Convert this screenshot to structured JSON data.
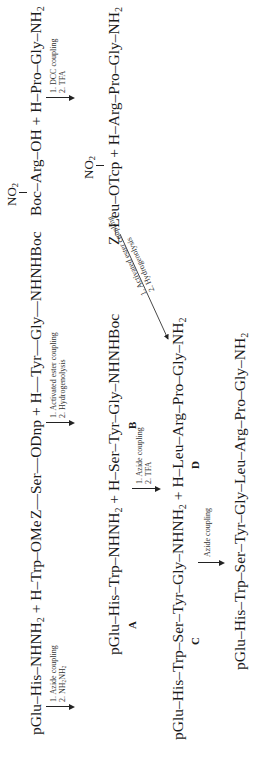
{
  "diagram": {
    "type": "peptide-synthesis-scheme",
    "orientation": "rotated-90-ccw",
    "row1": {
      "left": {
        "reactant1": "pGlu–His–NHNH",
        "reactant1_sub": "2",
        "plus": "+",
        "reactant2": "H–Trp–OMe",
        "step1": "1.  Azide coupling",
        "step2_prefix": "2.  NH",
        "step2_sub1": "2",
        "step2_mid": "NH",
        "step2_sub2": "2"
      },
      "middle": {
        "reactant1": "Z—Ser—ODnp",
        "plus": "+",
        "reactant2": "H—Tyr—Gly—NHNHBoc",
        "step1": "1.  Activated ester coupling",
        "step2": "2.  Hydrogenolysis"
      },
      "right": {
        "substituent": "NO",
        "substituent_sub": "2",
        "reactant1": "Boc–Arg–OH",
        "plus": "+",
        "reactant2_prefix": "H–Pro–Gly–NH",
        "reactant2_sub": "2",
        "step1": "1.  DCC coupling",
        "step2": "2.  TFA"
      }
    },
    "row2": {
      "left_prefix": "pGlu–His–Trp–NHNH",
      "left_sub": "2",
      "plus": "+",
      "right": "H–Ser–Tyr–Gly–NHNHBoc",
      "label_a": "A",
      "label_b": "B",
      "step1": "1.  Azide coupling",
      "step2": "2.  TFA",
      "far_right": {
        "substituent": "NO",
        "substituent_sub": "2",
        "reactant1": "Z–Leu–OTcp",
        "plus": "+",
        "reactant2_prefix": "H–Arg–Pro–Gly–NH",
        "reactant2_sub": "2",
        "step1": "1.  Activated ester coupling",
        "step2": "2.  Hydrogenolysis"
      }
    },
    "row3": {
      "left_prefix": "pGlu–His–Trp–Ser–Tyr–Gly–NHNH",
      "left_sub": "2",
      "plus": "+",
      "right_prefix": "H–Leu–Arg–Pro–Gly–NH",
      "right_sub": "2",
      "label_c": "C",
      "label_d": "D",
      "step": "Azide coupling"
    },
    "row4": {
      "product_prefix": "pGlu–His–Trp–Ser–Tyr–Gly–Leu–Arg–Pro–Gly–NH",
      "product_sub": "2"
    }
  }
}
